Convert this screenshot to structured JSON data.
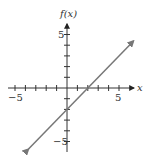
{
  "chart_data": {
    "type": "line",
    "title": "",
    "xlabel": "x",
    "ylabel": "f(x)",
    "xlim": [
      -5.5,
      6.5
    ],
    "ylim": [
      -5.8,
      6.2
    ],
    "x_ticks": [
      -5,
      -4,
      -3,
      -2,
      -1,
      1,
      2,
      3,
      4,
      5
    ],
    "y_ticks": [
      -5,
      -4,
      -3,
      -2,
      -1,
      1,
      2,
      3,
      4,
      5
    ],
    "x_tick_labels": [
      "-5",
      "5"
    ],
    "y_tick_labels": [
      "5",
      "-5"
    ],
    "grid": false,
    "legend": null,
    "series": [
      {
        "name": "f(x) = x - 2",
        "equation": "f(x) = x - 2",
        "slope": 1,
        "intercept": -2,
        "x": [
          -3.7,
          6.4
        ],
        "y": [
          -5.7,
          4.4
        ],
        "arrows_both_ends": true,
        "color": "#777777"
      }
    ],
    "annotations": {
      "x_intercept": [
        2,
        0
      ],
      "y_intercept": [
        0,
        -2
      ]
    }
  },
  "labels": {
    "x_axis": "x",
    "y_axis": "f(x)",
    "x_neg": "−5",
    "x_pos": "5",
    "y_pos": "5",
    "y_neg": "−5"
  },
  "colors": {
    "axis": "#333333",
    "line": "#777777",
    "background": "#ffffff"
  }
}
